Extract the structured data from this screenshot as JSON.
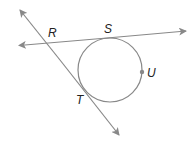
{
  "diagram": {
    "type": "geometry",
    "labels": {
      "R": "R",
      "S": "S",
      "T": "T",
      "U": "U"
    },
    "colors": {
      "line": "#888888",
      "text": "#222222",
      "point": "#888888"
    }
  }
}
